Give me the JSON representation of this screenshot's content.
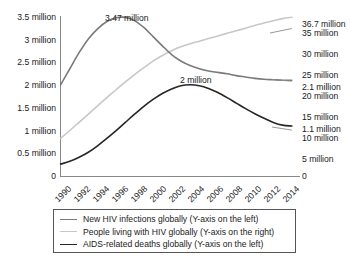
{
  "chart_data": {
    "type": "line",
    "title": "",
    "subtitle": "",
    "xlabel": "",
    "ylabel": "",
    "grid": false,
    "legend_position": "bottom",
    "x": [
      1990,
      1991,
      1992,
      1993,
      1994,
      1995,
      1996,
      1997,
      1998,
      1999,
      2000,
      2001,
      2002,
      2003,
      2004,
      2005,
      2006,
      2007,
      2008,
      2009,
      2010,
      2011,
      2012,
      2013,
      2014,
      2015
    ],
    "x_tick_labels": [
      "1990",
      "1992",
      "1994",
      "1996",
      "1998",
      "2000",
      "2002",
      "2004",
      "2006",
      "2008",
      "2010",
      "2012",
      "2014"
    ],
    "left_axis": {
      "label": "",
      "ylim": [
        0,
        3.5
      ],
      "unit": "million",
      "tick_labels": [
        "0",
        "0.5 million",
        "1 million",
        "1.5 million",
        "2 million",
        "2.5 million",
        "3 million",
        "3.5 million"
      ],
      "tick_values": [
        0,
        0.5,
        1,
        1.5,
        2,
        2.5,
        3,
        3.5
      ]
    },
    "right_axis": {
      "label": "",
      "ylim": [
        0,
        37
      ],
      "unit": "million",
      "tick_labels": [
        "0",
        "5 million",
        "10 million",
        "15 million",
        "20 million",
        "25 million",
        "30 million",
        "35 million"
      ],
      "tick_values": [
        0,
        5,
        10,
        15,
        20,
        25,
        30,
        35
      ]
    },
    "series": [
      {
        "name": "New HIV infections globally (Y-axis on the left)",
        "axis": "left",
        "color": "#7a7a7a",
        "values": [
          2.0,
          2.35,
          2.7,
          3.0,
          3.22,
          3.38,
          3.46,
          3.47,
          3.4,
          3.25,
          3.05,
          2.85,
          2.66,
          2.52,
          2.42,
          2.35,
          2.3,
          2.27,
          2.24,
          2.2,
          2.17,
          2.14,
          2.12,
          2.11,
          2.1,
          2.1
        ]
      },
      {
        "name": "People living with HIV globally (Y-axis on the right)",
        "axis": "right",
        "color": "#c8c8c8",
        "values": [
          8.8,
          10.6,
          12.5,
          14.4,
          16.3,
          18.2,
          20.0,
          21.8,
          23.5,
          25.1,
          26.6,
          27.9,
          29.0,
          29.9,
          30.6,
          31.2,
          31.8,
          32.4,
          33.0,
          33.6,
          34.2,
          34.8,
          35.4,
          35.9,
          36.4,
          36.7
        ]
      },
      {
        "name": "AIDS-related deaths globally (Y-axis on the left)",
        "axis": "left",
        "color": "#262626",
        "values": [
          0.27,
          0.33,
          0.42,
          0.53,
          0.67,
          0.83,
          1.0,
          1.18,
          1.36,
          1.53,
          1.68,
          1.81,
          1.91,
          1.98,
          2.0,
          1.98,
          1.92,
          1.83,
          1.72,
          1.6,
          1.48,
          1.37,
          1.27,
          1.18,
          1.12,
          1.1
        ]
      }
    ],
    "annotations": [
      {
        "name": "peak-new-infections",
        "text": "3.47 million",
        "x": 1996.5,
        "value": 3.47,
        "axis": "left"
      },
      {
        "name": "peak-aids-deaths",
        "text": "2 million",
        "x": 2004,
        "value": 2.0,
        "axis": "left"
      },
      {
        "name": "end-people-living",
        "text": "36.7 million",
        "x": 2015,
        "value": 36.7,
        "axis": "right"
      },
      {
        "name": "end-new-infections",
        "text": "2.1 million",
        "x": 2015,
        "value": 2.1,
        "axis": "left"
      },
      {
        "name": "end-aids-deaths",
        "text": "1.1 million",
        "x": 2015,
        "value": 1.1,
        "axis": "left"
      }
    ]
  },
  "legend": {
    "items": [
      {
        "label": "New HIV infections globally (Y-axis on the left)",
        "color": "#7a7a7a"
      },
      {
        "label": "People living with HIV globally (Y-axis on the right)",
        "color": "#c8c8c8"
      },
      {
        "label": "AIDS-related deaths globally (Y-axis on the left)",
        "color": "#262626"
      }
    ]
  }
}
